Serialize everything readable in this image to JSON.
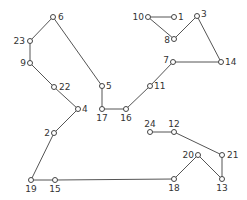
{
  "diagram": {
    "title": "",
    "line_color": "#555555",
    "node_color": "#444444",
    "nodes": [
      {
        "id": "6",
        "label": "6"
      },
      {
        "id": "23",
        "label": "23"
      },
      {
        "id": "9",
        "label": "9"
      },
      {
        "id": "22",
        "label": "22"
      },
      {
        "id": "4",
        "label": "4"
      },
      {
        "id": "2",
        "label": "2"
      },
      {
        "id": "19",
        "label": "19"
      },
      {
        "id": "15",
        "label": "15"
      },
      {
        "id": "18",
        "label": "18"
      },
      {
        "id": "20",
        "label": "20"
      },
      {
        "id": "13",
        "label": "13"
      },
      {
        "id": "21",
        "label": "21"
      },
      {
        "id": "12",
        "label": "12"
      },
      {
        "id": "24",
        "label": "24"
      },
      {
        "id": "5",
        "label": "5"
      },
      {
        "id": "17",
        "label": "17"
      },
      {
        "id": "16",
        "label": "16"
      },
      {
        "id": "11",
        "label": "11"
      },
      {
        "id": "7",
        "label": "7"
      },
      {
        "id": "14",
        "label": "14"
      },
      {
        "id": "3",
        "label": "3"
      },
      {
        "id": "8",
        "label": "8"
      },
      {
        "id": "10",
        "label": "10"
      },
      {
        "id": "1",
        "label": "1"
      }
    ],
    "edges": [
      [
        "6",
        "23"
      ],
      [
        "23",
        "9"
      ],
      [
        "9",
        "22"
      ],
      [
        "22",
        "4"
      ],
      [
        "4",
        "2"
      ],
      [
        "2",
        "19"
      ],
      [
        "19",
        "15"
      ],
      [
        "15",
        "18"
      ],
      [
        "18",
        "20"
      ],
      [
        "20",
        "13"
      ],
      [
        "13",
        "21"
      ],
      [
        "21",
        "12"
      ],
      [
        "12",
        "24"
      ],
      [
        "6",
        "5"
      ],
      [
        "5",
        "17"
      ],
      [
        "17",
        "16"
      ],
      [
        "16",
        "11"
      ],
      [
        "11",
        "7"
      ],
      [
        "7",
        "14"
      ],
      [
        "14",
        "3"
      ],
      [
        "3",
        "8"
      ],
      [
        "8",
        "10"
      ],
      [
        "10",
        "1"
      ]
    ]
  }
}
